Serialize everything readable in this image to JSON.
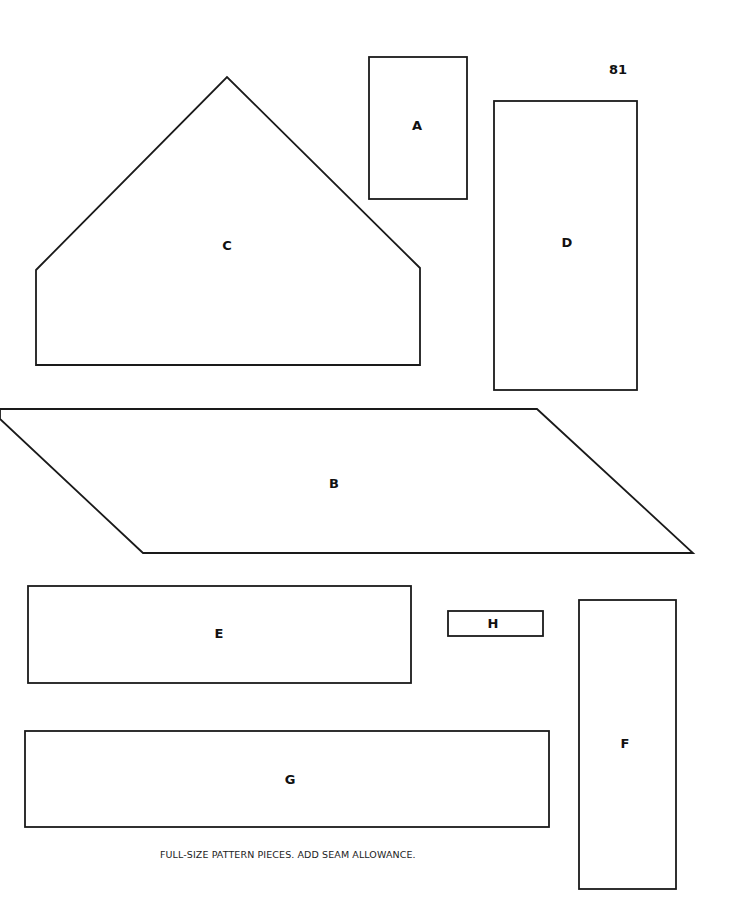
{
  "page": {
    "number": "81",
    "caption": "FULL-SIZE PATTERN PIECES. ADD SEAM ALLOWANCE."
  },
  "pieces": {
    "A": {
      "label": "A",
      "shape": "rectangle"
    },
    "B": {
      "label": "B",
      "shape": "parallelogram"
    },
    "C": {
      "label": "C",
      "shape": "pentagon (house gable)"
    },
    "D": {
      "label": "D",
      "shape": "rectangle"
    },
    "E": {
      "label": "E",
      "shape": "rectangle"
    },
    "F": {
      "label": "F",
      "shape": "rectangle"
    },
    "G": {
      "label": "G",
      "shape": "rectangle"
    },
    "H": {
      "label": "H",
      "shape": "rectangle"
    }
  },
  "colors": {
    "line": "#1a1a1a",
    "background": "#ffffff"
  }
}
